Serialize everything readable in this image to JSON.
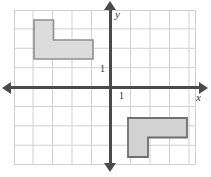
{
  "figure": {
    "type": "coordinate-plane-diagram",
    "title": "",
    "grid": {
      "visible": true,
      "cell_size_px": 19.5,
      "columns": 10,
      "rows": 8,
      "line_color": "#cfcfcf",
      "origin_cell_col": 5,
      "origin_cell_row": 4
    },
    "axes": {
      "color": "#4a4a4a",
      "x_label": "x",
      "y_label": "y",
      "x_tick_label": "1",
      "y_tick_label": "1",
      "x_arrows": [
        "left",
        "right"
      ],
      "y_arrows": [
        "up",
        "down"
      ]
    },
    "shapes": [
      {
        "name": "upper-left-L-polygon",
        "fill": "#dcdcdc",
        "stroke": "#888888",
        "quadrant": "II",
        "description": "L-shaped hexagon, 2 units tall on the left column, 3 units wide along the bottom row",
        "vertices_grid": [
          [
            -4,
            3
          ],
          [
            -3,
            3
          ],
          [
            -3,
            2
          ],
          [
            -1,
            2
          ],
          [
            -1,
            1
          ],
          [
            -4,
            1
          ]
        ]
      },
      {
        "name": "lower-right-L-polygon",
        "fill": "#d2d2d2",
        "stroke": "#767676",
        "quadrant": "IV",
        "description": "L-shaped hexagon, 3 units wide along the top row, 2 units tall on the left column",
        "vertices_grid": [
          [
            1,
            -2
          ],
          [
            4,
            -2
          ],
          [
            4,
            -3
          ],
          [
            2,
            -3
          ],
          [
            2,
            -4
          ],
          [
            1,
            -4
          ]
        ]
      }
    ]
  }
}
